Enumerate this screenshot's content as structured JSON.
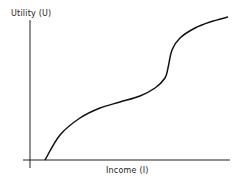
{
  "chart_data": {
    "type": "line",
    "title": "",
    "xlabel": "Income (I)",
    "ylabel": "Utility (U)",
    "x_ticks": [],
    "y_ticks": [],
    "grid": false,
    "legend": null,
    "series": [
      {
        "name": "Utility function",
        "description": "Concave at low income, convex in middle, sharp rise then concave at high income (Friedman-Savage utility curve)",
        "points_px": [
          [
            45,
            160
          ],
          [
            60,
            135
          ],
          [
            80,
            118
          ],
          [
            100,
            108
          ],
          [
            120,
            102
          ],
          [
            140,
            96
          ],
          [
            155,
            88
          ],
          [
            165,
            78
          ],
          [
            168,
            68
          ],
          [
            172,
            50
          ],
          [
            180,
            38
          ],
          [
            195,
            28
          ],
          [
            210,
            22
          ],
          [
            228,
            17
          ]
        ]
      }
    ]
  },
  "labels": {
    "y_axis": "Utility (U)",
    "x_axis": "Income (I)"
  }
}
